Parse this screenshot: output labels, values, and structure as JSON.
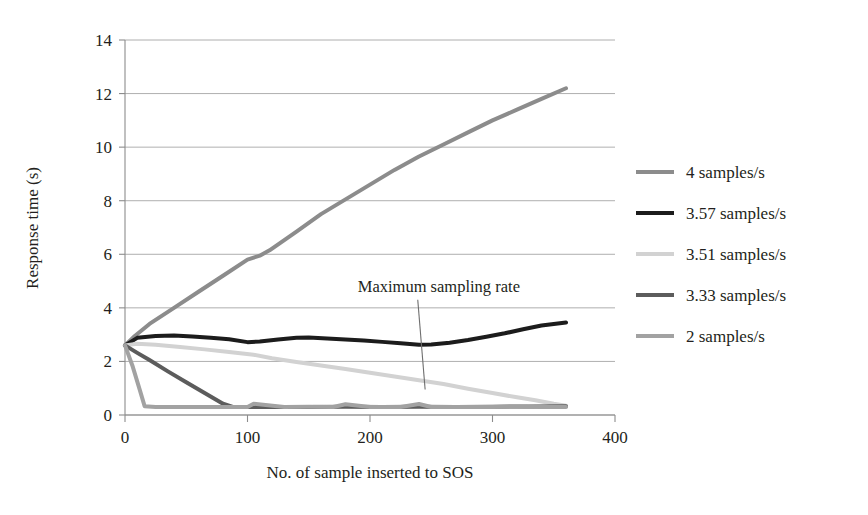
{
  "chart_data": {
    "type": "line",
    "title": "",
    "xlabel": "No. of sample inserted to SOS",
    "ylabel": "Response time (s)",
    "xlim": [
      0,
      400
    ],
    "ylim": [
      0,
      14
    ],
    "xticks": [
      "0",
      "100",
      "200",
      "300",
      "400"
    ],
    "yticks": [
      "0",
      "2",
      "4",
      "6",
      "8",
      "10",
      "12",
      "14"
    ],
    "grid": "horizontal",
    "legend_position": "right",
    "annotations": [
      {
        "text": "Maximum sampling rate",
        "x": 190,
        "y": 4.6,
        "points_to_x": 245,
        "points_to_y": 0.95
      }
    ],
    "series": [
      {
        "name": "4 samples/s",
        "color": "#8c8c8c",
        "width": 4.0,
        "x": [
          0,
          8,
          20,
          40,
          60,
          80,
          100,
          110,
          118,
          140,
          160,
          180,
          200,
          220,
          240,
          260,
          280,
          300,
          320,
          340,
          360
        ],
        "y": [
          2.6,
          2.95,
          3.4,
          4.0,
          4.6,
          5.2,
          5.8,
          5.95,
          6.15,
          6.85,
          7.5,
          8.05,
          8.6,
          9.15,
          9.65,
          10.1,
          10.55,
          11.0,
          11.4,
          11.8,
          12.2
        ]
      },
      {
        "name": "3.57 samples/s",
        "color": "#1c1c1c",
        "width": 4.0,
        "x": [
          0,
          10,
          25,
          40,
          55,
          70,
          85,
          100,
          110,
          125,
          140,
          150,
          165,
          180,
          195,
          210,
          225,
          240,
          250,
          265,
          280,
          295,
          310,
          325,
          340,
          350,
          360
        ],
        "y": [
          2.6,
          2.88,
          2.95,
          2.97,
          2.93,
          2.88,
          2.83,
          2.72,
          2.74,
          2.82,
          2.88,
          2.89,
          2.86,
          2.82,
          2.78,
          2.73,
          2.68,
          2.62,
          2.63,
          2.7,
          2.8,
          2.92,
          3.05,
          3.2,
          3.34,
          3.4,
          3.45
        ]
      },
      {
        "name": "3.51 samples/s",
        "color": "#d2d2d2",
        "width": 4.0,
        "x": [
          0,
          10,
          25,
          45,
          65,
          85,
          105,
          120,
          140,
          160,
          180,
          200,
          220,
          240,
          260,
          280,
          300,
          320,
          335,
          350,
          360
        ],
        "y": [
          2.6,
          2.66,
          2.62,
          2.54,
          2.45,
          2.35,
          2.25,
          2.12,
          1.98,
          1.85,
          1.72,
          1.58,
          1.44,
          1.3,
          1.16,
          0.98,
          0.82,
          0.66,
          0.55,
          0.42,
          0.35
        ]
      },
      {
        "name": "3.33 samples/s",
        "color": "#5c5c5c",
        "width": 4.0,
        "x": [
          0,
          10,
          20,
          35,
          50,
          65,
          80,
          88,
          100,
          120,
          150,
          180,
          210,
          240,
          270,
          300,
          330,
          360
        ],
        "y": [
          2.6,
          2.32,
          2.05,
          1.63,
          1.22,
          0.82,
          0.42,
          0.3,
          0.3,
          0.3,
          0.3,
          0.31,
          0.3,
          0.31,
          0.3,
          0.31,
          0.32,
          0.33
        ]
      },
      {
        "name": "2 samples/s",
        "color": "#a2a2a2",
        "width": 4.0,
        "x": [
          0,
          6,
          12,
          16,
          25,
          40,
          60,
          80,
          100,
          105,
          130,
          150,
          170,
          180,
          200,
          225,
          240,
          250,
          270,
          300,
          320,
          340,
          360
        ],
        "y": [
          2.6,
          1.85,
          0.95,
          0.33,
          0.3,
          0.3,
          0.3,
          0.3,
          0.3,
          0.42,
          0.3,
          0.31,
          0.3,
          0.4,
          0.3,
          0.3,
          0.41,
          0.3,
          0.3,
          0.3,
          0.31,
          0.3,
          0.3
        ]
      }
    ]
  },
  "legend": {
    "entries": [
      {
        "label": "4 samples/s",
        "color": "#8c8c8c"
      },
      {
        "label": "3.57 samples/s",
        "color": "#1c1c1c"
      },
      {
        "label": "3.51 samples/s",
        "color": "#d2d2d2"
      },
      {
        "label": "3.33 samples/s",
        "color": "#5c5c5c"
      },
      {
        "label": "2 samples/s",
        "color": "#a2a2a2"
      }
    ]
  }
}
